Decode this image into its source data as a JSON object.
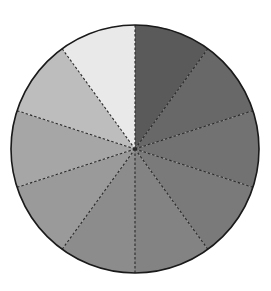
{
  "chart_data": {
    "type": "pie",
    "title": "",
    "categories": [
      "1",
      "2",
      "3",
      "4",
      "5",
      "6",
      "7",
      "8",
      "9",
      "10"
    ],
    "values": [
      10,
      10,
      10,
      10,
      10,
      10,
      10,
      10,
      10,
      10
    ],
    "colors": [
      "#5a5a5a",
      "#686868",
      "#727272",
      "#7a7a7a",
      "#838383",
      "#8c8c8c",
      "#9a9a9a",
      "#a6a6a6",
      "#bdbdbd",
      "#e9e9e9"
    ],
    "start_angle_deg": 0,
    "direction": "clockwise",
    "divider_style": "dashed",
    "legend": "none",
    "labels_shown": false
  },
  "layout": {
    "cx": 135,
    "cy": 149,
    "r": 124,
    "outline_color": "#1a1a1a",
    "divider_color": "#2a2a2a"
  }
}
